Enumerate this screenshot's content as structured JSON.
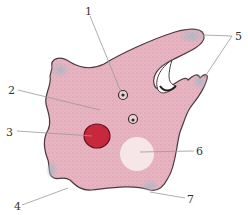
{
  "diagram": {
    "labels": [
      {
        "id": "1",
        "text": "1",
        "x": 85,
        "y": 6
      },
      {
        "id": "2",
        "text": "2",
        "x": 8,
        "y": 85
      },
      {
        "id": "3",
        "text": "3",
        "x": 6,
        "y": 127
      },
      {
        "id": "4",
        "text": "4",
        "x": 14,
        "y": 201
      },
      {
        "id": "5",
        "text": "5",
        "x": 235,
        "y": 31
      },
      {
        "id": "6",
        "text": "6",
        "x": 196,
        "y": 146
      },
      {
        "id": "7",
        "text": "7",
        "x": 187,
        "y": 194
      }
    ],
    "colors": {
      "cytoplasm": "#e9b4c1",
      "ectoplasm_tips": "#a9b9c7",
      "outline": "#4a3a40",
      "nucleus": "#c8283c",
      "vacuole": "#f6e6e8",
      "leader_line": "#999999"
    }
  }
}
